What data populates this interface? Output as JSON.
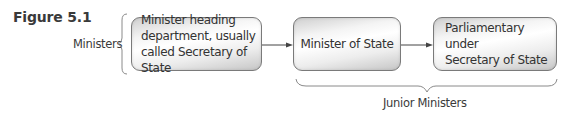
{
  "figure": {
    "title": "Figure 5.1"
  },
  "left_group": {
    "label": "Ministers"
  },
  "nodes": [
    {
      "id": "secretary-of-state",
      "text": "Minister heading department, usually called Secretary of State",
      "lines": [
        "Minister heading",
        "department, usually",
        "called Secretary of State"
      ]
    },
    {
      "id": "minister-of-state",
      "text": "Minister of State",
      "lines": [
        "Minister of State"
      ]
    },
    {
      "id": "parliamentary-under-secretary",
      "text": "Parliamentary under Secretary of State",
      "lines": [
        "Parliamentary under",
        "Secretary of State"
      ]
    }
  ],
  "edges": [
    {
      "from": "secretary-of-state",
      "to": "minister-of-state"
    },
    {
      "from": "minister-of-state",
      "to": "parliamentary-under-secretary"
    }
  ],
  "bottom_group": {
    "label": "Junior Ministers",
    "spans": [
      "minister-of-state",
      "parliamentary-under-secretary"
    ]
  },
  "colors": {
    "box_border": "#7a7a7a",
    "text": "#333333",
    "arrow": "#444444",
    "brace": "#8a8a8a"
  }
}
